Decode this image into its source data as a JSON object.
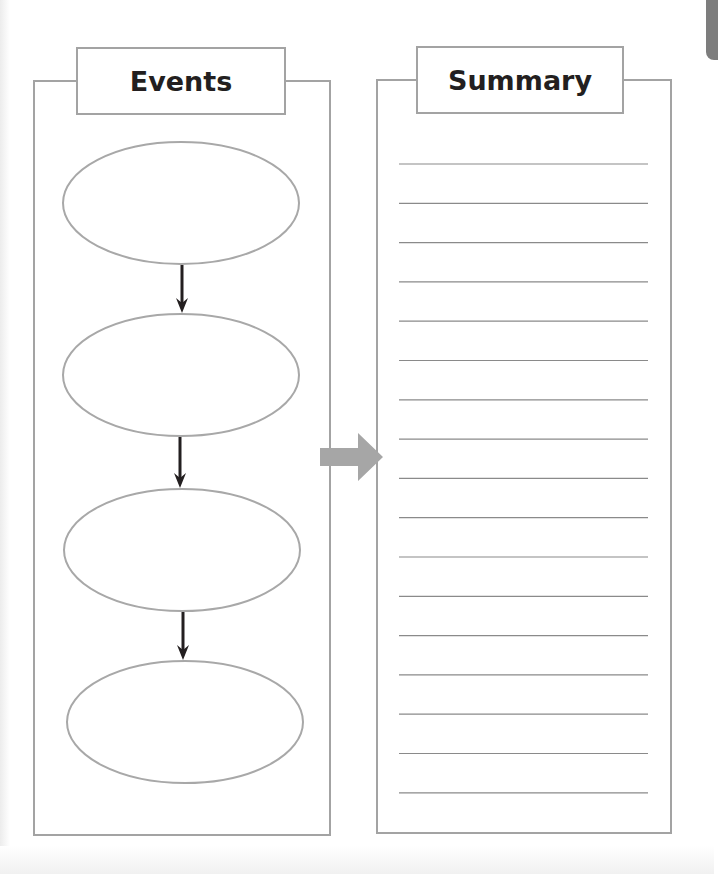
{
  "diagram": {
    "type": "graphic-organizer",
    "left_panel": {
      "title": "Events",
      "event_boxes": [
        {
          "label": "",
          "shape": "ellipse"
        },
        {
          "label": "",
          "shape": "ellipse"
        },
        {
          "label": "",
          "shape": "ellipse"
        },
        {
          "label": "",
          "shape": "ellipse"
        }
      ],
      "connectors": [
        "down-arrow",
        "down-arrow",
        "down-arrow"
      ]
    },
    "right_panel": {
      "title": "Summary",
      "writing_lines": 17
    },
    "link": {
      "from": "Events",
      "to": "Summary",
      "icon": "right-arrow-icon"
    },
    "colors": {
      "border": "#a3a3a3",
      "ellipse_stroke": "#a8a8a8",
      "small_arrow": "#231f20",
      "big_arrow": "#a6a6a6",
      "ruled_line": "#8a8a8a",
      "title_text": "#231f20",
      "corner_tab": "#7d7d7d"
    }
  }
}
